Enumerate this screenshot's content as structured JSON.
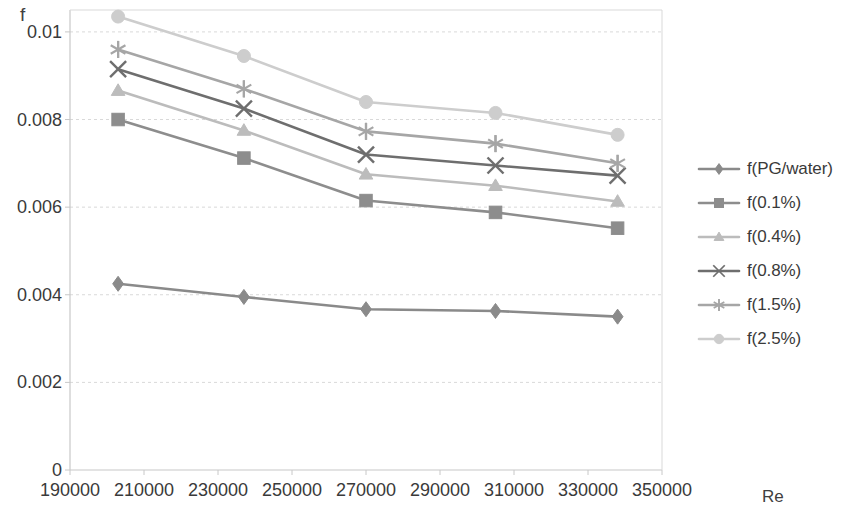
{
  "chart_data": {
    "type": "line",
    "title": "",
    "xlabel": "Re",
    "ylabel": "f",
    "x": [
      203000,
      237000,
      270000,
      305000,
      338000
    ],
    "xlim": [
      190000,
      350000
    ],
    "ylim": [
      0,
      0.0105
    ],
    "x_ticks": [
      "190000",
      "210000",
      "230000",
      "250000",
      "270000",
      "290000",
      "310000",
      "330000",
      "350000"
    ],
    "x_tick_values": [
      190000,
      210000,
      230000,
      250000,
      270000,
      290000,
      310000,
      330000,
      350000
    ],
    "y_ticks": [
      "0",
      "0.002",
      "0.004",
      "0.006",
      "0.008",
      "0.01"
    ],
    "y_tick_values": [
      0,
      0.002,
      0.004,
      0.006,
      0.008,
      0.01
    ],
    "grid": true,
    "legend_position": "right",
    "series": [
      {
        "name": "f(PG/water)",
        "marker": "diamond",
        "color": "#8a8a8a",
        "values": [
          0.00425,
          0.00395,
          0.00367,
          0.00363,
          0.0035
        ]
      },
      {
        "name": "f(0.1%)",
        "marker": "square",
        "color": "#8d8d8d",
        "values": [
          0.008,
          0.00712,
          0.00615,
          0.00588,
          0.00552
        ]
      },
      {
        "name": "f(0.4%)",
        "marker": "triangle",
        "color": "#bcbcbc",
        "values": [
          0.00866,
          0.00775,
          0.00675,
          0.00649,
          0.00613
        ]
      },
      {
        "name": "f(0.8%)",
        "marker": "cross",
        "color": "#6e6e6e",
        "values": [
          0.00915,
          0.00825,
          0.0072,
          0.00695,
          0.00672
        ]
      },
      {
        "name": "f(1.5%)",
        "marker": "asterisk",
        "color": "#a6a6a6",
        "values": [
          0.0096,
          0.0087,
          0.00773,
          0.00745,
          0.007
        ]
      },
      {
        "name": "f(2.5%)",
        "marker": "circle",
        "color": "#cdcdcd",
        "values": [
          0.01035,
          0.00945,
          0.0084,
          0.00815,
          0.00765
        ]
      }
    ]
  },
  "plot": {
    "left": 70,
    "right": 662,
    "top": 10,
    "bottom": 470,
    "grid_color": "#d9d9d9",
    "axis_color": "#c8c8c8"
  }
}
